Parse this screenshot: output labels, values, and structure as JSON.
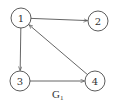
{
  "graph": {
    "caption": "G",
    "caption_subscript": "1",
    "directed": true,
    "colors": {
      "stroke": "#555555",
      "node_fill": "#ffffff",
      "text": "#333333"
    },
    "nodes": [
      {
        "id": "1",
        "label": "1",
        "cx": 21,
        "cy": 18
      },
      {
        "id": "2",
        "label": "2",
        "cx": 98,
        "cy": 21
      },
      {
        "id": "3",
        "label": "3",
        "cx": 20,
        "cy": 81
      },
      {
        "id": "4",
        "label": "4",
        "cx": 95,
        "cy": 81
      }
    ],
    "edges": [
      {
        "from": "1",
        "to": "2"
      },
      {
        "from": "1",
        "to": "3"
      },
      {
        "from": "3",
        "to": "4"
      },
      {
        "from": "4",
        "to": "1"
      }
    ]
  }
}
